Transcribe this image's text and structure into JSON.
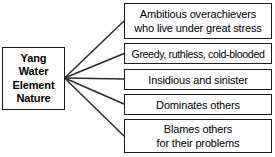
{
  "diagram": {
    "type": "fan-tree",
    "background_color": "#ffffff",
    "line_color": "#1a1a1a",
    "text_color": "#000000",
    "root": {
      "lines": [
        "Yang",
        "Water",
        "Element",
        "Nature"
      ],
      "bold": true
    },
    "branches": [
      {
        "lines": [
          "Ambitious overachievers",
          "who live under great stress"
        ]
      },
      {
        "lines": [
          "Greedy, ruthless, cold-blooded"
        ]
      },
      {
        "lines": [
          "Insidious and sinister"
        ]
      },
      {
        "lines": [
          "Dominates others"
        ]
      },
      {
        "lines": [
          "Blames others",
          "for their problems"
        ]
      }
    ]
  }
}
